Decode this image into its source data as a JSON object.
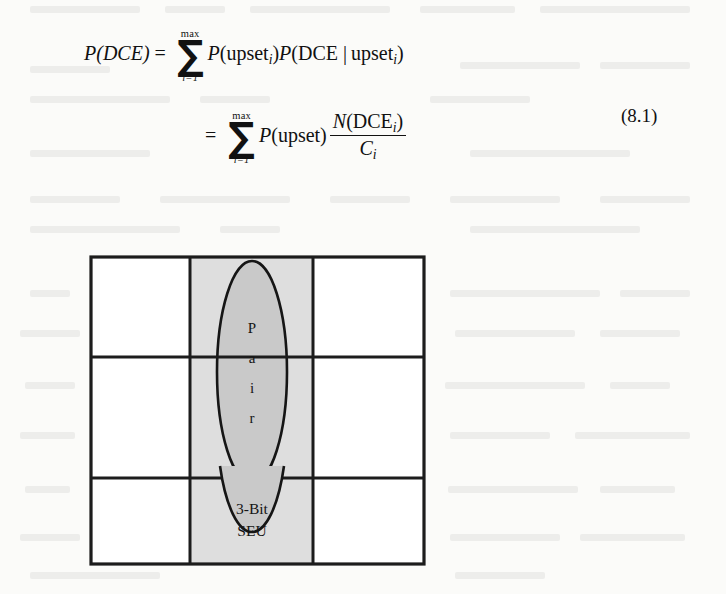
{
  "page": {
    "background_color": "#fbfbf9",
    "ink_color": "#111111"
  },
  "equation": {
    "number": "(8.1)",
    "line1": {
      "lhs": "P(DCE)",
      "relation": "=",
      "sum_upper": "max",
      "sum_lower": "i=1",
      "sum_symbol": "∑",
      "term1_fn": "P",
      "term1_open": "(",
      "term1_arg": "upset",
      "term1_sub": "i",
      "term1_close": ")",
      "term2_fn": "P",
      "term2_open": "(",
      "term2_arg1": "DCE",
      "term2_bar": "|",
      "term2_arg2": "upset",
      "term2_sub": "i",
      "term2_close": ")"
    },
    "line2": {
      "relation": "=",
      "sum_upper": "max",
      "sum_lower": "i=1",
      "sum_symbol": "∑",
      "term1_fn": "P",
      "term1_open": "(",
      "term1_arg": "upset",
      "term1_close": ")",
      "frac_num_fn": "N",
      "frac_num_open": "(",
      "frac_num_arg": "DCE",
      "frac_num_sub": "i",
      "frac_num_close": ")",
      "frac_den_var": "C",
      "frac_den_sub": "i"
    }
  },
  "figure": {
    "name": "3x3-memory-cell-grid",
    "grid": {
      "rows": 3,
      "columns": 3,
      "border_color": "#1c1c1c",
      "cell_fill": "#ffffff",
      "shaded_column_index": 1,
      "shaded_column_fill": "#dedede"
    },
    "ellipse": {
      "label_text": "Pair",
      "letters": [
        "P",
        "a",
        "i",
        "r"
      ],
      "fill": "#c9c9c9",
      "stroke": "#151515",
      "spans_rows": [
        0,
        1
      ]
    },
    "seu_label": {
      "line1": "3-Bit",
      "line2": "SEU"
    }
  }
}
